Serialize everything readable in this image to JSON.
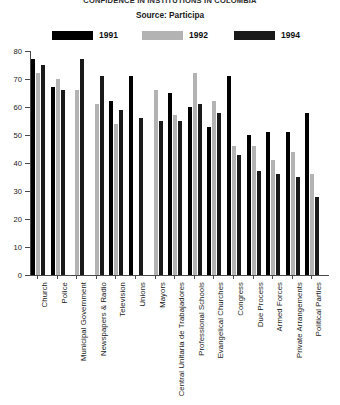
{
  "chart_data": {
    "type": "bar",
    "title": "CONFIDENCE IN INSTITUTIONS IN COLOMBIA",
    "subtitle": "Source: Participa",
    "source": "Source: Participa",
    "xlabel": "",
    "ylabel": "",
    "ylim": [
      0,
      80
    ],
    "ytick_step": 10,
    "yticks": [
      0,
      10,
      20,
      30,
      40,
      50,
      60,
      70,
      80
    ],
    "grid": false,
    "legend_position": "top",
    "categories": [
      "Church",
      "Police",
      "Municipal Government",
      "Newspapers & Radio",
      "Television",
      "Unions",
      "Mayors",
      "Central Unitaria de Trabajadores",
      "Professional Schools",
      "Evangelical Churches",
      "Congress",
      "Due Process",
      "Armed Forces",
      "Private Arrangements",
      "Political Parties"
    ],
    "series": [
      {
        "name": "1991",
        "color": "#000000",
        "values": [
          77,
          67,
          null,
          null,
          62,
          71,
          null,
          65,
          60,
          53,
          71,
          50,
          51,
          51,
          58
        ]
      },
      {
        "name": "1992",
        "color": "#b3b3b3",
        "values": [
          72,
          70,
          66,
          61,
          54,
          null,
          66,
          57,
          72,
          62,
          46,
          46,
          41,
          44,
          36
        ]
      },
      {
        "name": "1994",
        "color": "#1a1a1a",
        "values": [
          75,
          66,
          77,
          71,
          59,
          56,
          55,
          55,
          61,
          58,
          43,
          37,
          36,
          35,
          28
        ]
      }
    ]
  }
}
